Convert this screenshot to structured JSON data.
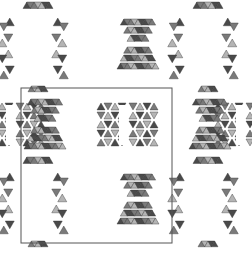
{
  "figure": {
    "description": "Polyhedral crystal structure projection with unit cell outline",
    "background": "#ffffff",
    "colors": {
      "dark_face": "#4a4a4a",
      "mid_face": "#7a7a7a",
      "light_face": "#b4b4b4",
      "edge": "#333333",
      "cell_line": "#555555"
    },
    "unit_cell": {
      "x": 21,
      "y": 88,
      "width": 151,
      "height": 155
    },
    "clusters": [
      {
        "type": "hourglass-vertical",
        "cx": 38,
        "cy": 50
      },
      {
        "type": "hourglass-vertical",
        "cx": 38,
        "cy": 205
      },
      {
        "type": "hourglass-vertical",
        "cx": 208,
        "cy": 50
      },
      {
        "type": "hourglass-vertical",
        "cx": 208,
        "cy": 205
      },
      {
        "type": "hourglass-horizontal",
        "cx": 123,
        "cy": 125
      },
      {
        "type": "hourglass-horizontal",
        "cx": 10,
        "cy": 125
      },
      {
        "type": "hourglass-horizontal",
        "cx": 240,
        "cy": 125
      },
      {
        "type": "bowtie",
        "cx": 138,
        "cy": 45
      },
      {
        "type": "bowtie",
        "cx": 138,
        "cy": 200
      },
      {
        "type": "bowtie",
        "cx": 45,
        "cy": 125
      },
      {
        "type": "bowtie",
        "cx": 210,
        "cy": 125
      }
    ]
  }
}
